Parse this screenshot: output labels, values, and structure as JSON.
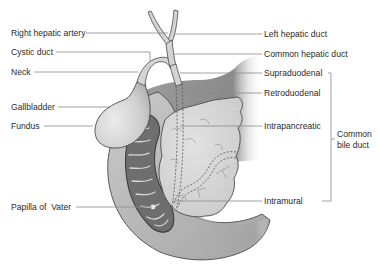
{
  "figure": {
    "labels_left": [
      {
        "id": "right-hepatic-artery",
        "text": "Right hepatic artery"
      },
      {
        "id": "cystic-duct",
        "text": "Cystic duct"
      },
      {
        "id": "neck",
        "text": "Neck"
      },
      {
        "id": "gallbladder",
        "text": "Gallbladder"
      },
      {
        "id": "fundus",
        "text": "Fundus"
      },
      {
        "id": "papilla-of-vater",
        "text": "Papilla of  Vater"
      }
    ],
    "labels_right": [
      {
        "id": "left-hepatic-duct",
        "text": "Left hepatic duct"
      },
      {
        "id": "common-hepatic-duct",
        "text": "Common hepatic duct"
      },
      {
        "id": "supraduodenal",
        "text": "Supraduodenal"
      },
      {
        "id": "retroduodenal",
        "text": "Retroduodenal"
      },
      {
        "id": "intrapancreatic",
        "text": "Intrapancreatic"
      },
      {
        "id": "intramural",
        "text": "Intramural"
      }
    ],
    "bracket_label": {
      "id": "common-bile-duct",
      "lines": [
        "Common",
        "bile duct"
      ],
      "groups": [
        "Supraduodenal",
        "Retroduodenal",
        "Intrapancreatic",
        "Intramural"
      ]
    },
    "colors": {
      "background": "#ffffff",
      "label_text": "#2b2b2b",
      "leader_line": "#8a8a8a",
      "liver_dark": "#8c8c8c",
      "gallbladder": "#d2d2d2",
      "duodenum_wall": "#bdbdbd",
      "duodenum_lumen": "#6e6e6e",
      "pancreas": "#d6d6d6"
    }
  }
}
